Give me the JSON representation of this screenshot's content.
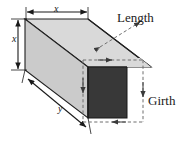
{
  "figure": {
    "type": "geometry-diagram",
    "labels": {
      "length": "Length",
      "girth": "Girth",
      "width_top": "x",
      "height_side": "x",
      "depth_long": "y"
    },
    "colors": {
      "front_face": "#383838",
      "top_face": "#d8d8d8",
      "side_face": "#c9c9c9",
      "outline": "#202020",
      "dimension_line": "#1a1a1a",
      "dashed_line": "#7a7a7a",
      "background": "#ffffff",
      "text": "#1a1a1a"
    },
    "geometry": {
      "front_face_rect": {
        "x": 88,
        "y": 67,
        "width": 39,
        "height": 51
      },
      "box_top_left": {
        "x": 25,
        "y": 19
      },
      "box_bottom_left": {
        "x": 25,
        "y": 70
      },
      "offset_x": 63,
      "offset_y": 48
    },
    "dimension_arrows": [
      {
        "name": "width-top",
        "label": "x",
        "orientation": "horizontal",
        "from": {
          "x": 26,
          "y": 11
        },
        "to": {
          "x": 88,
          "y": 11
        }
      },
      {
        "name": "height-left",
        "label": "x",
        "orientation": "vertical",
        "from": {
          "x": 17,
          "y": 19
        },
        "to": {
          "x": 17,
          "y": 70
        }
      },
      {
        "name": "depth-diagonal",
        "label": "y",
        "orientation": "diagonal",
        "from": {
          "x": 27,
          "y": 79
        },
        "to": {
          "x": 87,
          "y": 128
        }
      }
    ],
    "dashed_measures": [
      {
        "name": "length-dashed",
        "label": "Length",
        "orientation": "diagonal",
        "from": {
          "x": 99,
          "y": 48
        },
        "to": {
          "x": 141,
          "y": 21
        }
      },
      {
        "name": "girth-top-dashed",
        "orientation": "horizontal",
        "from": {
          "x": 83,
          "y": 60
        },
        "to": {
          "x": 143,
          "y": 60
        }
      },
      {
        "name": "girth-right-dashed",
        "label": "Girth",
        "orientation": "vertical",
        "from": {
          "x": 143,
          "y": 60
        },
        "to": {
          "x": 143,
          "y": 122
        }
      },
      {
        "name": "girth-bottom-dashed",
        "orientation": "horizontal",
        "from": {
          "x": 143,
          "y": 122
        },
        "to": {
          "x": 82,
          "y": 122
        }
      },
      {
        "name": "girth-left-dashed",
        "orientation": "vertical",
        "from": {
          "x": 83,
          "y": 60
        },
        "to": {
          "x": 83,
          "y": 122
        }
      }
    ]
  }
}
